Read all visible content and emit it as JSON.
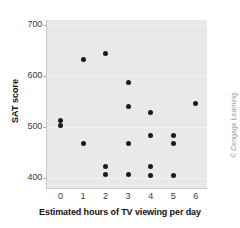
{
  "chart_data": {
    "type": "scatter",
    "title": "",
    "xlabel": "Estimated hours of TV viewing per day",
    "ylabel": "SAT score",
    "xlim": [
      -0.6,
      6.5
    ],
    "ylim": [
      380,
      710
    ],
    "xticks": [
      "0",
      "1",
      "2",
      "3",
      "4",
      "5",
      "6"
    ],
    "xtick_values": [
      0,
      1,
      2,
      3,
      4,
      5,
      6
    ],
    "yticks": [
      "700",
      "600",
      "500",
      "400"
    ],
    "ytick_values": [
      700,
      600,
      500,
      400
    ],
    "grid": false,
    "legend": null,
    "marker_color": "#1a1a1a",
    "panel_color": "#e9e9e9",
    "points": [
      {
        "x": 0,
        "y": 513
      },
      {
        "x": 0,
        "y": 502
      },
      {
        "x": 1,
        "y": 632
      },
      {
        "x": 1,
        "y": 468
      },
      {
        "x": 2,
        "y": 645
      },
      {
        "x": 2,
        "y": 423
      },
      {
        "x": 2,
        "y": 406
      },
      {
        "x": 3,
        "y": 587
      },
      {
        "x": 3,
        "y": 541
      },
      {
        "x": 3,
        "y": 468
      },
      {
        "x": 3,
        "y": 406
      },
      {
        "x": 4,
        "y": 529
      },
      {
        "x": 4,
        "y": 483
      },
      {
        "x": 4,
        "y": 422
      },
      {
        "x": 4,
        "y": 405
      },
      {
        "x": 5,
        "y": 483
      },
      {
        "x": 5,
        "y": 468
      },
      {
        "x": 5,
        "y": 405
      },
      {
        "x": 6,
        "y": 546
      }
    ]
  },
  "credit": "© Cengage Learning"
}
